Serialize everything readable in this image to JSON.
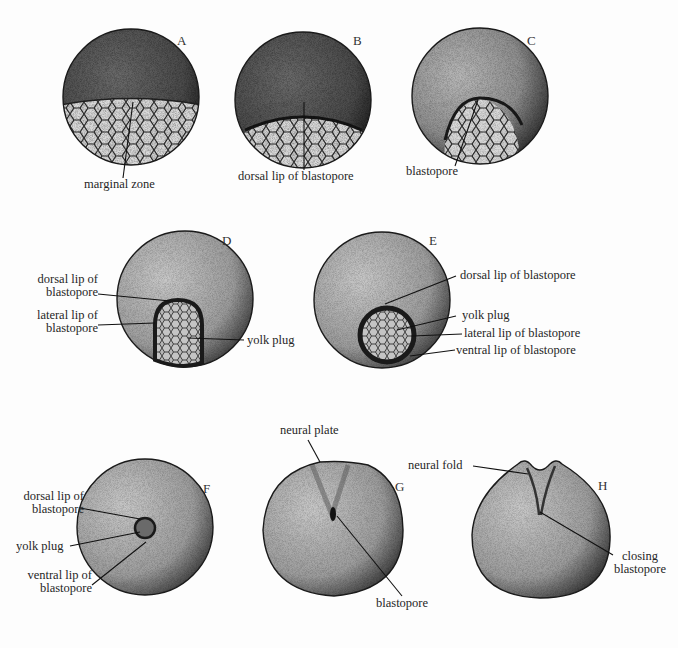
{
  "figure": {
    "panels": [
      {
        "id": "A",
        "letter": "A",
        "labels": [
          "marginal zone"
        ]
      },
      {
        "id": "B",
        "letter": "B",
        "labels": [
          "dorsal lip of blastopore"
        ]
      },
      {
        "id": "C",
        "letter": "C",
        "labels": [
          "blastopore"
        ]
      },
      {
        "id": "D",
        "letter": "D",
        "labels": [
          "dorsal lip of blastopore",
          "lateral lip of blastopore",
          "yolk plug"
        ]
      },
      {
        "id": "E",
        "letter": "E",
        "labels": [
          "dorsal lip of blastopore",
          "yolk plug",
          "lateral lip of blastopore",
          "ventral lip of blastopore"
        ]
      },
      {
        "id": "F",
        "letter": "F",
        "labels": [
          "dorsal lip of blastopore",
          "yolk plug",
          "ventral lip of blastopore"
        ]
      },
      {
        "id": "G",
        "letter": "G",
        "labels": [
          "neural plate",
          "blastopore"
        ]
      },
      {
        "id": "H",
        "letter": "H",
        "labels": [
          "neural fold",
          "closing blastopore"
        ]
      }
    ],
    "text": {
      "A_marginal": "marginal zone",
      "B_dorsal": "dorsal lip of blastopore",
      "C_blastopore": "blastopore",
      "D_dorsal_1": "dorsal lip of",
      "D_dorsal_2": "blastopore",
      "D_lateral_1": "lateral lip of",
      "D_lateral_2": "blastopore",
      "D_yolk": "yolk plug",
      "E_dorsal": "dorsal lip of blastopore",
      "E_yolk": "yolk plug",
      "E_lateral": "lateral lip of blastopore",
      "E_ventral": "ventral lip of blastopore",
      "F_dorsal_1": "dorsal lip of",
      "F_dorsal_2": "blastopore",
      "F_yolk": "yolk plug",
      "F_ventral_1": "ventral lip of",
      "F_ventral_2": "blastopore",
      "G_neural_plate": "neural plate",
      "G_blastopore": "blastopore",
      "H_neural_fold": "neural fold",
      "H_closing_1": "closing",
      "H_closing_2": "blastopore"
    }
  }
}
